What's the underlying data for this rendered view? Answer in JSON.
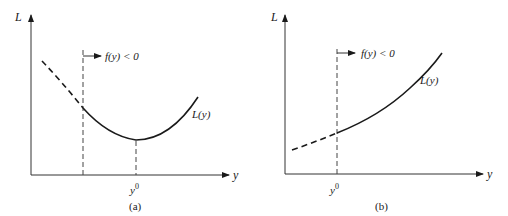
{
  "figure": {
    "panels": [
      {
        "id": "a",
        "caption": "(a)",
        "y_axis_label": "L",
        "x_axis_label": "y",
        "curve_label": "L(y)",
        "constraint_label": "f(y) < 0",
        "marker_label_base": "y",
        "marker_label_sup": "0",
        "description": "Convex L(y) with unconstrained minimum at y0 lying inside the feasible region f(y) < 0; curve dashed in infeasible region"
      },
      {
        "id": "b",
        "caption": "(b)",
        "y_axis_label": "L",
        "x_axis_label": "y",
        "curve_label": "L(y)",
        "constraint_label": "f(y) < 0",
        "marker_label_base": "y",
        "marker_label_sup": "0",
        "description": "Increasing L(y); constrained minimum at boundary y0 of feasible region f(y) < 0; curve dashed in infeasible region"
      }
    ]
  }
}
